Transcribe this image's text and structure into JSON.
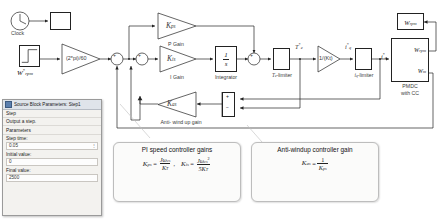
{
  "diagram": {
    "clock": {
      "label": "Clock",
      "display_value": ""
    },
    "step_source": {
      "label": "W*rpm",
      "label_main": "W",
      "label_sup": "*",
      "label_sub": "rpm"
    },
    "rads_gain": {
      "label": "(2*pi)/60"
    },
    "p_gain": {
      "name": "P Gain",
      "symbol": "K",
      "symbol_sub": "ps"
    },
    "i_gain": {
      "name": "I Gain",
      "symbol": "K",
      "symbol_sub": "is"
    },
    "integrator": {
      "name": "Integrator",
      "num": "1",
      "den": "s"
    },
    "te_limiter": {
      "name": "Te-limiter",
      "name_main": "T",
      "name_sub": "e",
      "name_suffix": "-limiter"
    },
    "te_signal": {
      "main": "T",
      "sup": "*",
      "sub": "e"
    },
    "kt_gain": {
      "label": "1/(Kt)"
    },
    "iq_signal": {
      "main": "i",
      "sup": "*",
      "sub": "q"
    },
    "iq_limiter": {
      "name": "iq-limiter",
      "name_main": "i",
      "name_sub": "q",
      "name_suffix": "-limiter"
    },
    "antiwindup_gain": {
      "name": "Anti- wind up gain",
      "symbol": "K",
      "symbol_sub": "as"
    },
    "motor_block": {
      "name_line1": "PMDC",
      "name_line2": "with CC",
      "input_port": {
        "main": "i",
        "sup": "*",
        "sub": "q"
      },
      "out1": {
        "main": "W",
        "sub": "rpm"
      },
      "out2": {
        "main": "W",
        "sub": "m"
      }
    },
    "display_rpm": {
      "main": "W",
      "sub": "rpm"
    },
    "sum_signs": {
      "plus": "+",
      "minus": "−"
    }
  },
  "dialog": {
    "title": "Source Block Parameters: Step1",
    "block_type": "Step",
    "description": "Output a step.",
    "section": "Parameters",
    "fields": [
      {
        "label": "Step time:",
        "value": "0.05"
      },
      {
        "label": "Initial value:",
        "value": "0"
      },
      {
        "label": "Final value:",
        "value": "2500"
      }
    ]
  },
  "callouts": [
    {
      "title": "PI speed controller gains",
      "equations": [
        {
          "lhs": "K",
          "lhs_sub": "ps",
          "num": "Jω",
          "num_sub": "cs",
          "num_sup": "",
          "den": "K",
          "den_sub": "T"
        },
        {
          "lhs": "K",
          "lhs_sub": "is",
          "num": "Jω",
          "num_sub": "cs",
          "num_sup": "2",
          "den": "5K",
          "den_sub": "T"
        }
      ]
    },
    {
      "title": "Anti-windup controller gain",
      "equations": [
        {
          "lhs": "K",
          "lhs_sub": "as",
          "num": "1",
          "num_sub": "",
          "num_sup": "",
          "den": "K",
          "den_sub": "ps"
        }
      ]
    }
  ],
  "colors": {
    "line": "#222222",
    "block_bg": "#ffffff",
    "dialog_bg": "#f3f2ef",
    "callout_bg": "#fbfbfa"
  }
}
